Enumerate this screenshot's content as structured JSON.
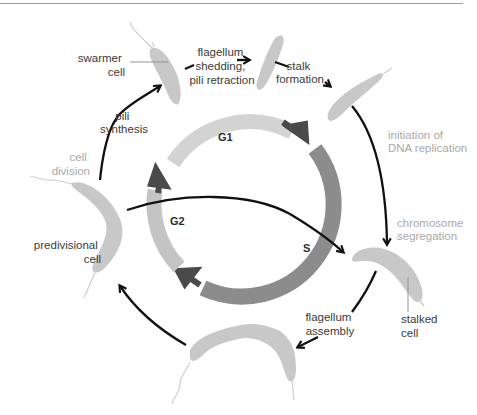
{
  "colors": {
    "top_rule": "#9a9a9a",
    "cell_fill": "#c8c8c8",
    "g1_arc": "#d3d3d3",
    "g2_arc": "#c4c4c4",
    "s_arc": "#8c8c8c",
    "phase_arrow": "#4a4a4a",
    "arrow": "#111111",
    "text_dark": "#3a3a3a",
    "text_gray": "#a9a9a9"
  },
  "phases": {
    "g1": "G1",
    "s": "S",
    "g2": "G2"
  },
  "cells": {
    "swarmer": {
      "line1": "swarmer",
      "line2": "cell"
    },
    "predivisional": {
      "line1": "predivisional",
      "line2": "cell"
    },
    "stalked": {
      "line1": "stalked",
      "line2": "cell"
    }
  },
  "transitions": {
    "pili_synthesis": {
      "line1": "pili",
      "line2": "synthesis"
    },
    "flagellum_shedding": {
      "line1": "flagellum",
      "line2": "shedding,",
      "line3": "pili retraction"
    },
    "stalk_formation": {
      "line1": "stalk",
      "line2": "formation"
    },
    "flagellum_assembly": {
      "line1": "flagellum",
      "line2": "assembly"
    }
  },
  "events": {
    "cell_division": {
      "line1": "cell",
      "line2": "division"
    },
    "initiation_dna_replication": {
      "line1": "initiation of",
      "line2": "DNA replication"
    },
    "chromosome_segregation": {
      "line1": "chromosome",
      "line2": "segregation"
    }
  }
}
